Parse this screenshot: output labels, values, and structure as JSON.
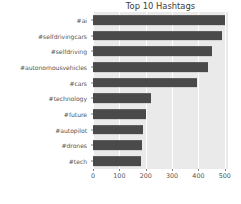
{
  "chart_data": {
    "type": "bar",
    "orientation": "horizontal",
    "title": "Top 10 Hashtags",
    "xlabel": "",
    "ylabel": "",
    "categories": [
      "#ai",
      "#selfdrivingcars",
      "#selfdriving",
      "#autonomousvehicles",
      "#cars",
      "#technology",
      "#future",
      "#autopilot",
      "#drones",
      "#tech"
    ],
    "values": [
      500,
      490,
      450,
      435,
      395,
      220,
      200,
      190,
      185,
      183
    ],
    "xlim": [
      0,
      512
    ],
    "xticks": [
      0,
      100,
      200,
      300,
      400,
      500
    ],
    "xtick_labels": [
      "0",
      "100",
      "200",
      "300",
      "400",
      "500"
    ],
    "grid": true,
    "legend": false,
    "bar_color": "#4a4a4a",
    "plot_background": "#eaeaea",
    "figure_background": "#ffffff",
    "gridline_color": "#ffffff"
  }
}
